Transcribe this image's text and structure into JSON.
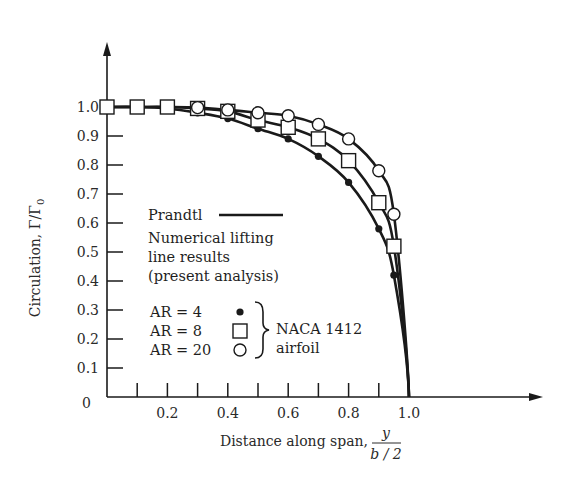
{
  "chart_data": {
    "type": "line",
    "title": "",
    "xlabel": "Distance along span, y/(b/2)",
    "xlabel_parts": {
      "prefix": "Distance along span,",
      "numerator": "y",
      "denominator": "b / 2"
    },
    "ylabel": "Circulation, Γ/Γ0",
    "ylabel_parts": {
      "text": "Circulation, Γ/Γ",
      "sub": "0"
    },
    "xlim": [
      0,
      1.0
    ],
    "ylim": [
      0,
      1.0
    ],
    "grid": false,
    "x_ticks": [
      0.1,
      0.2,
      0.3,
      0.4,
      0.5,
      0.6,
      0.7,
      0.8,
      0.9,
      1.0
    ],
    "x_tick_labels": [
      {
        "x": 0.2,
        "label": "0.2"
      },
      {
        "x": 0.4,
        "label": "0.4"
      },
      {
        "x": 0.6,
        "label": "0.6"
      },
      {
        "x": 0.8,
        "label": "0.8"
      },
      {
        "x": 1.0,
        "label": "1.0"
      }
    ],
    "y_ticks": [
      0,
      0.1,
      0.2,
      0.3,
      0.4,
      0.5,
      0.6,
      0.7,
      0.8,
      0.9,
      1.0
    ],
    "y_tick_labels": [
      "0",
      "0.1",
      "0.2",
      "0.3",
      "0.4",
      "0.5",
      "0.6",
      "0.7",
      "0.8",
      "0.9",
      "1.0"
    ],
    "series": [
      {
        "name": "AR = 4",
        "marker": "filled-circle",
        "x": [
          0,
          0.1,
          0.2,
          0.3,
          0.4,
          0.5,
          0.6,
          0.7,
          0.8,
          0.9,
          0.95,
          1.0
        ],
        "values": [
          1.0,
          1.0,
          0.995,
          0.98,
          0.96,
          0.925,
          0.89,
          0.83,
          0.74,
          0.58,
          0.42,
          0.0
        ]
      },
      {
        "name": "AR = 8",
        "marker": "open-square",
        "x": [
          0,
          0.1,
          0.2,
          0.3,
          0.4,
          0.5,
          0.6,
          0.7,
          0.8,
          0.9,
          0.95,
          1.0
        ],
        "values": [
          1.0,
          1.0,
          1.0,
          0.995,
          0.985,
          0.955,
          0.93,
          0.89,
          0.815,
          0.67,
          0.52,
          0.0
        ]
      },
      {
        "name": "AR = 20",
        "marker": "open-circle",
        "x": [
          0,
          0.1,
          0.2,
          0.3,
          0.4,
          0.5,
          0.6,
          0.7,
          0.8,
          0.9,
          0.95,
          1.0
        ],
        "values": [
          1.0,
          1.0,
          1.0,
          0.998,
          0.99,
          0.98,
          0.97,
          0.94,
          0.89,
          0.78,
          0.63,
          0.0
        ]
      }
    ],
    "legend": {
      "prandtl_label": "Prandtl",
      "numerical_lines": [
        "Numerical lifting",
        "line results",
        "(present analysis)"
      ],
      "entries": [
        {
          "label": "AR = 4",
          "marker": "filled-circle"
        },
        {
          "label": "AR = 8",
          "marker": "open-square"
        },
        {
          "label": "AR = 20",
          "marker": "open-circle"
        }
      ],
      "bracket_lines": [
        "NACA 1412",
        "airfoil"
      ],
      "position": "inside-lower-left"
    }
  }
}
